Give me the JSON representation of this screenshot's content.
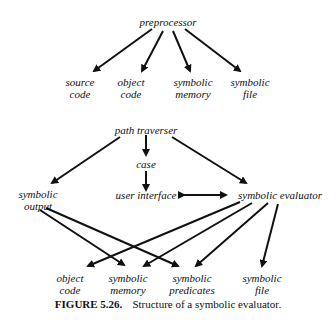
{
  "diagram": {
    "top": {
      "root": "preprocessor",
      "children": [
        {
          "line1": "source",
          "line2": "code"
        },
        {
          "line1": "object",
          "line2": "code"
        },
        {
          "line1": "symbolic",
          "line2": "memory"
        },
        {
          "line1": "symbolic",
          "line2": "file"
        }
      ]
    },
    "bottom": {
      "path_traverser": "path traverser",
      "case": "case",
      "user_interface": "user interface",
      "symbolic_evaluator": "symbolic evaluator",
      "symbolic_output": {
        "line1": "symbolic",
        "line2": "output"
      },
      "leaves": [
        {
          "line1": "object",
          "line2": "code"
        },
        {
          "line1": "symbolic",
          "line2": "memory"
        },
        {
          "line1": "symbolic",
          "line2": "predicates"
        },
        {
          "line1": "symbolic",
          "line2": "file"
        }
      ]
    }
  },
  "caption": {
    "label": "FIGURE 5.26.",
    "text": "Structure of a symbolic evaluator."
  }
}
